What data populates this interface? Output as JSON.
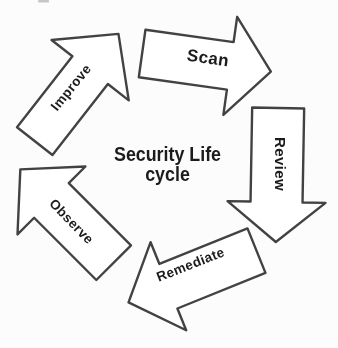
{
  "title": {
    "line1": "Security Life",
    "line2": "cycle"
  },
  "cycle": {
    "type": "circular-process-diagram",
    "direction": "clockwise",
    "stages": [
      {
        "label": "Scan"
      },
      {
        "label": "Review"
      },
      {
        "label": "Remediate"
      },
      {
        "label": "Observe"
      },
      {
        "label": "Improve"
      }
    ]
  },
  "colors": {
    "background": "#fcfcfc",
    "arrow_fill": "#ffffff",
    "arrow_outline": "#434343",
    "label_text": "#1d1d1d",
    "title_text": "#1b1b1b"
  }
}
